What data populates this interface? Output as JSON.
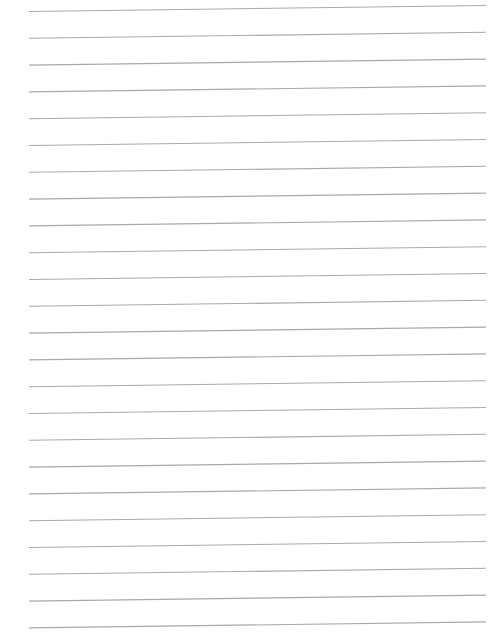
{
  "page": {
    "type": "lined-paper",
    "background_color": "#ffffff",
    "content_text": ""
  },
  "ruling": {
    "line_count": 24,
    "line_color": "#a9a9a9",
    "line_width": 1.1,
    "x_start": 29,
    "x_end": 486,
    "first_line_y_left": 11.5,
    "first_line_y_right": 5.5,
    "spacing": 26.8
  }
}
